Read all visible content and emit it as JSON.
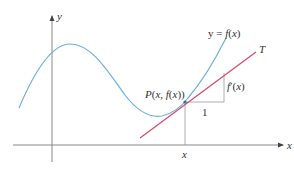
{
  "diagram": {
    "labels": {
      "y_axis": "y",
      "x_axis": "x",
      "curve": "y = f(x)",
      "tangent": "T",
      "point": "P(x, f(x))",
      "rise": "f′(x)",
      "run": "1",
      "x_tick": "x"
    },
    "colors": {
      "curve": "#6ab0de",
      "tangent": "#d9486a",
      "axes": "#888888",
      "guides": "#999999",
      "text": "#333333"
    }
  }
}
